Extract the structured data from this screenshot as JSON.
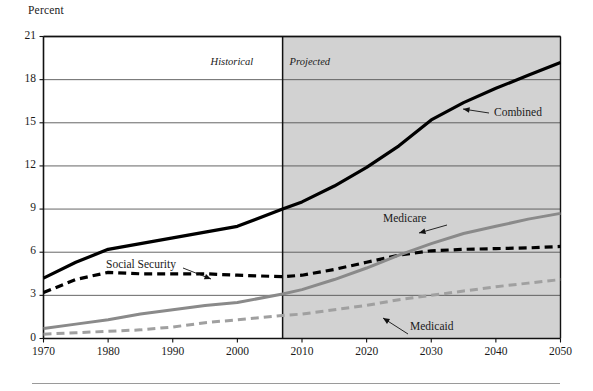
{
  "chart_data": {
    "type": "line",
    "title": "",
    "xlabel": "",
    "ylabel": "Percent",
    "ylim": [
      0,
      21
    ],
    "xlim": [
      1970,
      2050
    ],
    "yticks": [
      0,
      3,
      6,
      9,
      12,
      15,
      18,
      21
    ],
    "xticks": [
      1970,
      1980,
      1990,
      2000,
      2010,
      2020,
      2030,
      2040,
      2050
    ],
    "grid": "horizontal",
    "legend_position": "inline-annotations",
    "annotations": [
      {
        "text": "Historical",
        "style": "italic",
        "region": "left-of-divider"
      },
      {
        "text": "Projected",
        "style": "italic",
        "region": "right-of-divider"
      }
    ],
    "divider_x": 2007,
    "shaded_region": {
      "from": 2007,
      "to": 2050,
      "color": "#d2d2d2"
    },
    "series": [
      {
        "name": "Combined",
        "color": "#000000",
        "style": "solid",
        "width": 3.2,
        "x": [
          1970,
          1975,
          1980,
          1985,
          1990,
          1995,
          2000,
          2007,
          2010,
          2015,
          2020,
          2025,
          2030,
          2035,
          2040,
          2045,
          2050
        ],
        "values": [
          4.2,
          5.3,
          6.2,
          6.6,
          7.0,
          7.4,
          7.8,
          9.0,
          9.5,
          10.6,
          11.9,
          13.4,
          15.2,
          16.4,
          17.4,
          18.3,
          19.2
        ]
      },
      {
        "name": "Social Security",
        "color": "#000000",
        "style": "dashed",
        "width": 3.2,
        "x": [
          1970,
          1975,
          1980,
          1985,
          1990,
          1995,
          2000,
          2007,
          2010,
          2015,
          2020,
          2025,
          2030,
          2035,
          2040,
          2045,
          2050
        ],
        "values": [
          3.2,
          4.1,
          4.6,
          4.5,
          4.5,
          4.5,
          4.4,
          4.3,
          4.4,
          4.8,
          5.3,
          5.8,
          6.1,
          6.2,
          6.25,
          6.3,
          6.4
        ]
      },
      {
        "name": "Medicare",
        "color": "#8a8a8a",
        "style": "solid",
        "width": 3.0,
        "x": [
          1970,
          1975,
          1980,
          1985,
          1990,
          1995,
          2000,
          2007,
          2010,
          2015,
          2020,
          2025,
          2030,
          2035,
          2040,
          2045,
          2050
        ],
        "values": [
          0.7,
          1.0,
          1.3,
          1.7,
          2.0,
          2.3,
          2.5,
          3.1,
          3.4,
          4.1,
          4.9,
          5.8,
          6.6,
          7.3,
          7.8,
          8.3,
          8.7
        ]
      },
      {
        "name": "Medicaid",
        "color": "#a0a0a0",
        "style": "dashed",
        "width": 3.0,
        "x": [
          1970,
          1975,
          1980,
          1985,
          1990,
          1995,
          2000,
          2007,
          2010,
          2015,
          2020,
          2025,
          2030,
          2035,
          2040,
          2045,
          2050
        ],
        "values": [
          0.3,
          0.4,
          0.5,
          0.6,
          0.8,
          1.1,
          1.3,
          1.6,
          1.7,
          2.0,
          2.3,
          2.7,
          3.0,
          3.3,
          3.6,
          3.85,
          4.1
        ]
      }
    ]
  },
  "labels": {
    "y_axis_title": "Percent",
    "historical": "Historical",
    "projected": "Projected",
    "combined": "Combined",
    "social_security": "Social Security",
    "medicare": "Medicare",
    "medicaid": "Medicaid"
  },
  "colors": {
    "shaded_projection": "#d2d2d2",
    "gridline": "#555555",
    "axis": "#111111",
    "combined": "#000000",
    "social_security": "#000000",
    "medicare": "#8a8a8a",
    "medicaid": "#a0a0a0"
  }
}
